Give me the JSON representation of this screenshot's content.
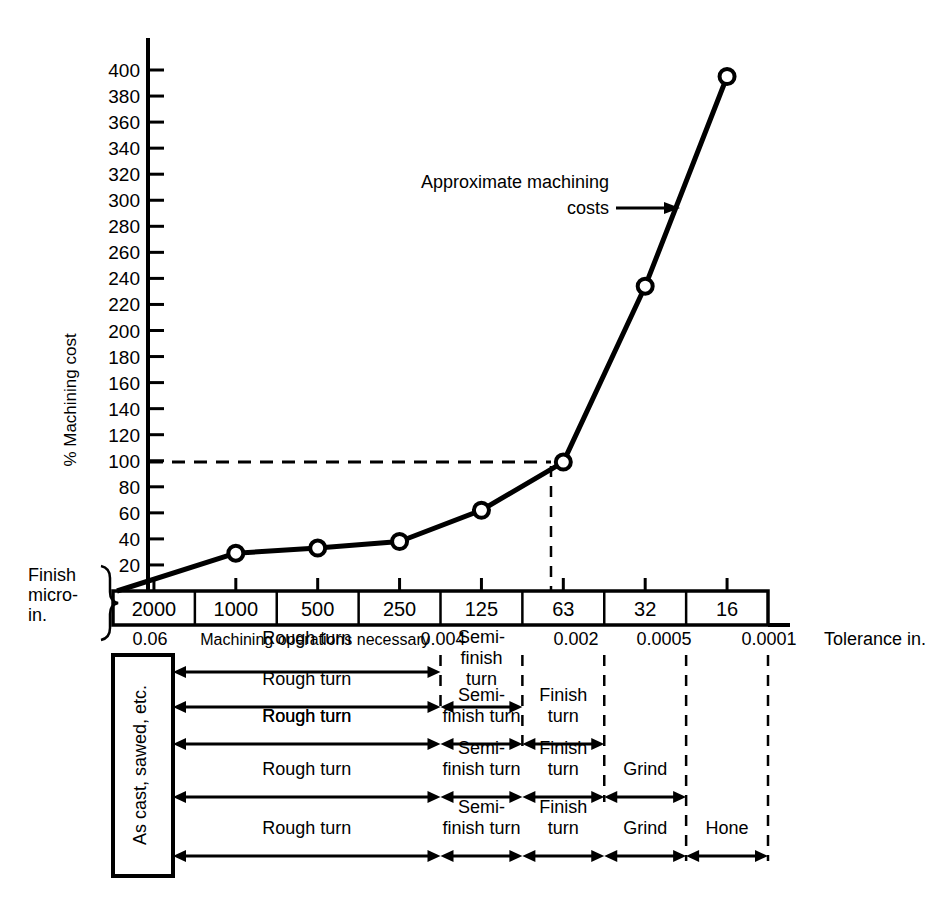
{
  "chart_data": {
    "type": "line",
    "title": "",
    "xlabel": "Finish micro-in.",
    "ylabel": "% Machining cost",
    "ylim": [
      0,
      410
    ],
    "yticks": [
      20,
      40,
      60,
      80,
      100,
      120,
      140,
      160,
      180,
      200,
      220,
      240,
      260,
      280,
      300,
      320,
      340,
      360,
      380,
      400
    ],
    "categories": [
      "2000",
      "1000",
      "500",
      "250",
      "125",
      "63",
      "32",
      "16"
    ],
    "x": [
      "2000",
      "1000",
      "500",
      "250",
      "125",
      "63",
      "32",
      "16"
    ],
    "values": [
      0,
      29,
      33,
      38,
      62,
      99,
      234,
      395
    ],
    "series": [
      {
        "name": "Approximate machining costs",
        "values": [
          0,
          29,
          33,
          38,
          62,
          99,
          234,
          395
        ]
      }
    ],
    "annotations": [
      {
        "text": "Approximate machining",
        "text2": "costs",
        "points_to": "63-to-32 segment"
      },
      {
        "text": "100% reference line at 63 micro-in."
      }
    ],
    "grid": false,
    "legend": "none",
    "marker": "open-circle"
  },
  "axis": {
    "y_label": "% Machining cost",
    "y_ticks": [
      "400",
      "380",
      "360",
      "340",
      "320",
      "300",
      "280",
      "260",
      "240",
      "220",
      "200",
      "180",
      "160",
      "140",
      "120",
      "100",
      "80",
      "60",
      "40",
      "20"
    ]
  },
  "annotation": {
    "line1": "Approximate machining",
    "line2": "costs"
  },
  "finish_axis": {
    "label_line1": "Finish",
    "label_line2": "micro-",
    "label_line3": "in.",
    "cells": [
      "2000",
      "1000",
      "500",
      "250",
      "125",
      "63",
      "32",
      "16"
    ]
  },
  "tolerance_axis": {
    "name": "Tolerance in.",
    "caption": "Machining operations necessary",
    "values": [
      "0.06",
      "0.004",
      "0.002",
      "0.0005",
      "0.0001"
    ]
  },
  "operations_table": {
    "stock_label": "As cast, sawed, etc.",
    "rows": [
      {
        "segments": [
          {
            "label": "Rough turn",
            "from": 0,
            "to": 4
          }
        ]
      },
      {
        "segments": [
          {
            "label": "Rough turn",
            "from": 0,
            "to": 4
          },
          {
            "label": "Semi-finish turn",
            "from": 4,
            "to": 5
          }
        ]
      },
      {
        "segments": [
          {
            "label": "Rough turn",
            "from": 0,
            "to": 4
          },
          {
            "label": "Semi-finish turn",
            "from": 4,
            "to": 5
          },
          {
            "label": "Finish turn",
            "from": 5,
            "to": 6
          }
        ]
      },
      {
        "segments": [
          {
            "label": "Rough turn",
            "from": 0,
            "to": 4
          },
          {
            "label": "Semi-finish turn",
            "from": 4,
            "to": 5
          },
          {
            "label": "Finish turn",
            "from": 5,
            "to": 6
          },
          {
            "label": "Grind",
            "from": 6,
            "to": 7
          }
        ]
      },
      {
        "segments": [
          {
            "label": "Rough turn",
            "from": 0,
            "to": 4
          },
          {
            "label": "Semi-finish turn",
            "from": 4,
            "to": 5
          },
          {
            "label": "Finish turn",
            "from": 5,
            "to": 6
          },
          {
            "label": "Grind",
            "from": 6,
            "to": 7
          },
          {
            "label": "Hone",
            "from": 7,
            "to": 8
          }
        ]
      }
    ],
    "row1_extra_label": "Rough turn",
    "row2_semi_stack": [
      "Semi-",
      "finish",
      "turn"
    ],
    "semi_stack_2line": [
      "Semi-",
      "finish turn"
    ],
    "finish_stack_2line": [
      "Finish",
      "turn"
    ]
  },
  "colors": {
    "ink": "#000000",
    "paper": "#ffffff"
  }
}
